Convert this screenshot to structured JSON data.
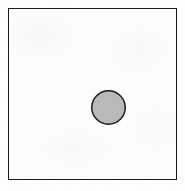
{
  "figure": {
    "caption": "",
    "background_color": "#fdfdfd",
    "frame": {
      "name": "rectangular-border",
      "stroke_color": "#1a1a1a",
      "stroke_width_px": 1.5,
      "fill_color": "#fcfcfc",
      "left_px": 8,
      "top_px": 8,
      "width_px": 169,
      "height_px": 172
    },
    "shapes": [
      {
        "name": "circle",
        "type": "circle",
        "center_x_px": 108.5,
        "center_y_px": 107.5,
        "radius_px": 17.5,
        "diameter_px": 35,
        "fill_color": "#b9b9b9",
        "stroke_color": "#1c1c1c",
        "stroke_width_px": 1.5,
        "label": ""
      }
    ]
  },
  "chart_data": {
    "type": "scatter",
    "title": "",
    "xlabel": "",
    "ylabel": "",
    "grid": false,
    "legend": "none",
    "xlim": [
      0,
      169
    ],
    "ylim": [
      0,
      172
    ],
    "categories": [
      "circle"
    ],
    "series": [
      {
        "name": "circle",
        "marker": "o",
        "marker_size_px": 35,
        "marker_facecolor": "#b9b9b9",
        "marker_edgecolor": "#1c1c1c",
        "x": [
          100.5
        ],
        "y": [
          72.5
        ]
      }
    ],
    "annotations": []
  }
}
